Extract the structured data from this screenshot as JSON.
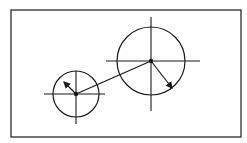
{
  "diagram": {
    "width": 247,
    "height": 143,
    "background": "#ffffff",
    "stroke_color": "#1a1a1a",
    "frame": {
      "x": 11,
      "y": 10,
      "width": 230,
      "height": 127
    },
    "circles": [
      {
        "id": "small",
        "cx": 76,
        "cy": 94,
        "r": 23,
        "crosshair": {
          "h_x1": 44,
          "h_x2": 105,
          "v_y1": 71,
          "v_y2": 124
        },
        "arrow": {
          "x2": 64,
          "y2": 82
        }
      },
      {
        "id": "large",
        "cx": 151,
        "cy": 61,
        "r": 34,
        "crosshair": {
          "h_x1": 106,
          "h_x2": 200,
          "v_y1": 17,
          "v_y2": 111
        },
        "arrow": {
          "x2": 172,
          "y2": 88
        }
      }
    ],
    "connector": {
      "x1": 76,
      "y1": 94,
      "x2": 151,
      "y2": 61
    }
  }
}
